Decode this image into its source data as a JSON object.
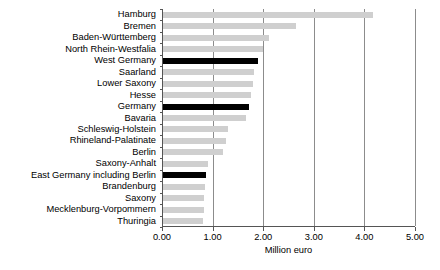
{
  "chart_data": {
    "type": "bar",
    "orientation": "horizontal",
    "title": "",
    "xlabel": "Million euro",
    "ylabel": "",
    "xlim": [
      0.0,
      5.0
    ],
    "xticks": [
      "0.00",
      "1.00",
      "2.00",
      "3.00",
      "4.00",
      "5.00"
    ],
    "xtick_values": [
      0.0,
      1.0,
      2.0,
      3.0,
      4.0,
      5.0
    ],
    "grid": true,
    "grid_axis": "x",
    "legend": false,
    "colors": {
      "bar_normal": "#cfcfcf",
      "bar_highlight": "#000000",
      "axis": "#555555",
      "gridline": "#8c8c8c"
    },
    "categories": [
      "Hamburg",
      "Bremen",
      "Baden-Württemberg",
      "North Rhein-Westfalia",
      "West Germany",
      "Saarland",
      "Lower Saxony",
      "Hesse",
      "Germany",
      "Bavaria",
      "Schleswig-Holstein",
      "Rhineland-Palatinate",
      "Berlin",
      "Saxony-Anhalt",
      "East Germany including Berlin",
      "Brandenburg",
      "Saxony",
      "Mecklenburg-Vorpommern",
      "Thuringia"
    ],
    "values": [
      4.15,
      2.63,
      2.1,
      1.98,
      1.88,
      1.8,
      1.78,
      1.74,
      1.7,
      1.64,
      1.29,
      1.25,
      1.19,
      0.89,
      0.85,
      0.83,
      0.82,
      0.81,
      0.8
    ],
    "highlighted": [
      "West Germany",
      "Germany",
      "East Germany including Berlin"
    ]
  }
}
